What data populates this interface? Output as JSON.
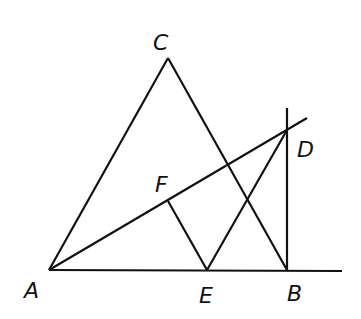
{
  "diagram": {
    "type": "geometry-figure",
    "stroke_color": "#111111",
    "background": "#ffffff",
    "points": [
      {
        "name": "A",
        "x": 49,
        "y": 270,
        "label_x": 24,
        "label_y": 298
      },
      {
        "name": "B",
        "x": 287,
        "y": 270,
        "label_x": 287,
        "label_y": 301
      },
      {
        "name": "C",
        "x": 168,
        "y": 58,
        "label_x": 153,
        "label_y": 50
      },
      {
        "name": "D",
        "x": 287,
        "y": 130,
        "label_x": 297,
        "label_y": 157
      },
      {
        "name": "E",
        "x": 207,
        "y": 270,
        "label_x": 199,
        "label_y": 303
      },
      {
        "name": "F",
        "x": 168,
        "y": 201,
        "label_x": 155,
        "label_y": 192
      }
    ],
    "segments": [
      {
        "id": "AC",
        "from": "A",
        "to": "C"
      },
      {
        "id": "CB",
        "from": "C",
        "to": "B"
      },
      {
        "id": "AB-extended",
        "from": "A",
        "to": "B",
        "extends_to": [
          342,
          271
        ]
      },
      {
        "id": "AD-extended",
        "from": "A",
        "to": "D",
        "extends_to": [
          307,
          118
        ]
      },
      {
        "id": "BD-perpendicular",
        "from": "B",
        "to": "D",
        "extends_to": [
          287,
          108
        ]
      },
      {
        "id": "FE",
        "from": "F",
        "to": "E"
      },
      {
        "id": "ED",
        "from": "E",
        "to": "D"
      }
    ]
  },
  "labels": {
    "A": "A",
    "B": "B",
    "C": "C",
    "D": "D",
    "E": "E",
    "F": "F"
  }
}
